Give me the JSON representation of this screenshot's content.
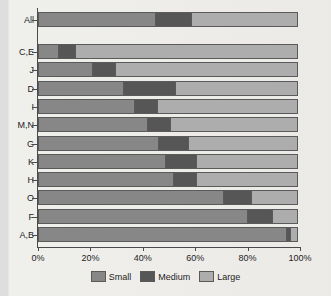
{
  "chart_data": {
    "type": "bar",
    "orientation": "horizontal",
    "stacked": true,
    "normalized": true,
    "title": "",
    "xlabel": "",
    "ylabel": "",
    "xlim": [
      0,
      100
    ],
    "grid": false,
    "legend_position": "bottom",
    "categories": [
      "All",
      "C,E",
      "J",
      "D",
      "I",
      "M,N",
      "G",
      "K",
      "H",
      "O",
      "F",
      "A,B"
    ],
    "xticks": [
      0,
      20,
      40,
      60,
      80,
      100
    ],
    "xtick_labels": [
      "0%",
      "20%",
      "40%",
      "60%",
      "80%",
      "100%"
    ],
    "series": [
      {
        "name": "Small",
        "color": "#878787",
        "values": [
          45,
          8,
          21,
          33,
          37,
          42,
          46,
          49,
          52,
          71,
          80,
          95
        ]
      },
      {
        "name": "Medium",
        "color": "#565656",
        "values": [
          14,
          7,
          9,
          20,
          9,
          9,
          12,
          12,
          9,
          11,
          10,
          2
        ]
      },
      {
        "name": "Large",
        "color": "#adadad",
        "values": [
          41,
          85,
          70,
          47,
          54,
          49,
          42,
          39,
          39,
          18,
          10,
          3
        ]
      }
    ]
  }
}
